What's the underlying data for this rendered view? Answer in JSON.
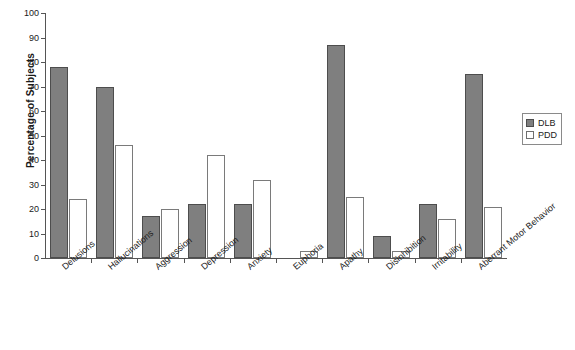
{
  "chart_data": {
    "type": "bar",
    "title": "",
    "xlabel": "",
    "ylabel": "Percentage of Subjects",
    "ylim": [
      0,
      100
    ],
    "yticks": [
      0,
      10,
      20,
      30,
      40,
      50,
      60,
      70,
      80,
      90,
      100
    ],
    "grid": false,
    "legend_position": "right",
    "categories": [
      "Delusions",
      "Hallucinations",
      "Aggression",
      "Depression",
      "Anxiety",
      "Euphoria",
      "Apathy",
      "Disinhibition",
      "Irritability",
      "Aberrant Motor Behavior"
    ],
    "series": [
      {
        "name": "DLB",
        "color": "#7f7f7f",
        "values": [
          78,
          70,
          17,
          22,
          22,
          0,
          87,
          9,
          22,
          75
        ]
      },
      {
        "name": "PDD",
        "color": "#ffffff",
        "values": [
          24,
          46,
          20,
          42,
          32,
          3,
          25,
          3,
          16,
          21
        ]
      }
    ]
  },
  "legend": {
    "items": [
      {
        "label": "DLB",
        "swatch": "filled-gray-square"
      },
      {
        "label": "PDD",
        "swatch": "white-square"
      }
    ]
  }
}
